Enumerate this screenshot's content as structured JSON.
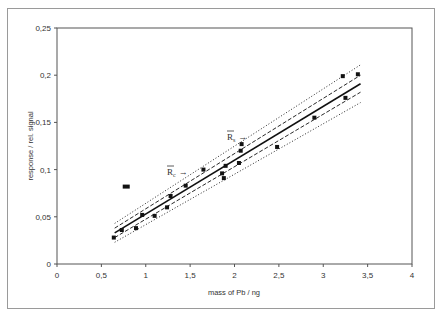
{
  "chart_data": {
    "type": "scatter",
    "title": "",
    "xlabel": "mass of Pb / ng",
    "ylabel": "response / rel. signal",
    "xlim": [
      0,
      4
    ],
    "ylim": [
      0,
      0.25
    ],
    "x_ticks": [
      0,
      0.5,
      1,
      1.5,
      2,
      2.5,
      3,
      3.5,
      4
    ],
    "x_tick_labels": [
      "0",
      "0,5",
      "1",
      "1,5",
      "2",
      "2,5",
      "3",
      "3,5",
      "4"
    ],
    "y_ticks": [
      0,
      0.05,
      0.1,
      0.15,
      0.2,
      0.25
    ],
    "y_tick_labels": [
      "0",
      "0,05",
      "0,1",
      "0,15",
      "0,2",
      "0,25"
    ],
    "grid": false,
    "legend": null,
    "series": [
      {
        "name": "measurements",
        "kind": "points",
        "marker": "square",
        "points": [
          [
            0.64,
            0.028
          ],
          [
            0.73,
            0.036
          ],
          [
            0.89,
            0.038
          ],
          [
            0.96,
            0.052
          ],
          [
            1.1,
            0.051
          ],
          [
            1.24,
            0.06
          ],
          [
            1.28,
            0.072
          ],
          [
            1.45,
            0.083
          ],
          [
            1.65,
            0.1
          ],
          [
            1.86,
            0.096
          ],
          [
            1.88,
            0.091
          ],
          [
            1.9,
            0.104
          ],
          [
            2.05,
            0.107
          ],
          [
            2.07,
            0.12
          ],
          [
            2.08,
            0.127
          ],
          [
            2.48,
            0.124
          ],
          [
            2.9,
            0.155
          ],
          [
            3.22,
            0.199
          ],
          [
            3.25,
            0.176
          ],
          [
            3.39,
            0.201
          ]
        ]
      },
      {
        "name": "outlier",
        "kind": "points",
        "marker": "wide-square",
        "points": [
          [
            0.78,
            0.082
          ]
        ]
      },
      {
        "name": "regression line",
        "kind": "line",
        "style": "solid",
        "points": [
          [
            0.65,
            0.033
          ],
          [
            3.42,
            0.191
          ]
        ]
      },
      {
        "name": "confidence band upper",
        "kind": "line",
        "style": "dashed",
        "points": [
          [
            0.65,
            0.038
          ],
          [
            3.42,
            0.2
          ]
        ]
      },
      {
        "name": "confidence band lower",
        "kind": "line",
        "style": "dashed",
        "points": [
          [
            0.65,
            0.028
          ],
          [
            3.42,
            0.182
          ]
        ]
      },
      {
        "name": "prediction band upper",
        "kind": "line",
        "style": "dotted",
        "points": [
          [
            0.65,
            0.043
          ],
          [
            3.42,
            0.211
          ]
        ]
      },
      {
        "name": "prediction band lower",
        "kind": "line",
        "style": "dotted",
        "points": [
          [
            0.65,
            0.023
          ],
          [
            3.42,
            0.171
          ]
        ]
      }
    ],
    "annotations": [
      {
        "text": "R",
        "subscript": "c",
        "arrow": "→",
        "x": 1.32,
        "y": 0.098,
        "overbar": true
      },
      {
        "text": "R",
        "subscript": "s",
        "arrow": "→",
        "x": 1.9,
        "y": 0.135,
        "overbar": true
      }
    ]
  },
  "labels": {
    "xlabel": "mass of Pb / ng",
    "ylabel": "response / rel. signal",
    "annot_c_main": "R",
    "annot_c_sub": "c",
    "annot_s_main": "R",
    "annot_s_sub": "s",
    "arrow": "→"
  }
}
